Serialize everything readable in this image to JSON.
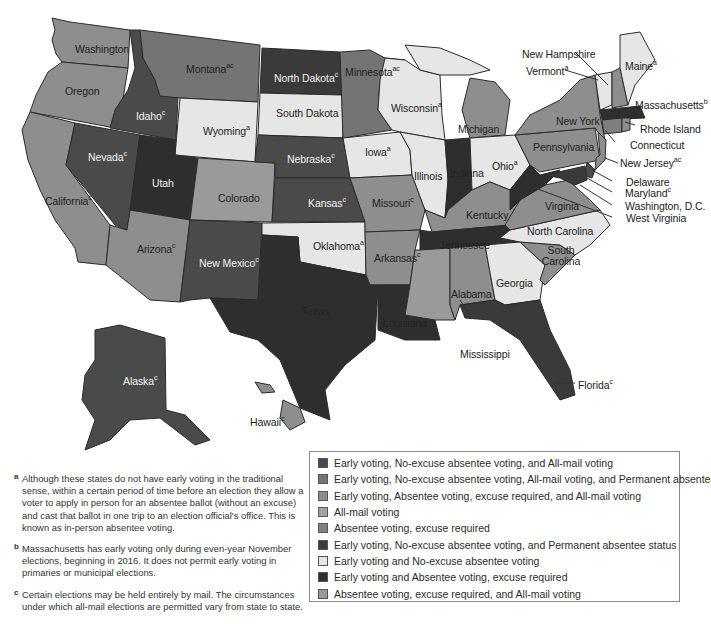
{
  "colors": {
    "c1": "#4a4a4a",
    "c2": "#747474",
    "c3": "#8e8e8e",
    "c4": "#a5a5a5",
    "c5": "#7f7f7f",
    "c6": "#3a3a3a",
    "c7": "#e6e6e6",
    "c8": "#2e2e2e",
    "c9": "#9a9a9a"
  },
  "legend": {
    "items": [
      {
        "label": "Early voting, No-excuse absentee voting, and All-mail voting",
        "swatch": "#4a4a4a"
      },
      {
        "label": "Early voting, No-excuse absentee voting, All-mail voting, and Permanent absentee status",
        "swatch": "#747474"
      },
      {
        "label": "Early voting, Absentee voting, excuse required, and All-mail voting",
        "swatch": "#8e8e8e"
      },
      {
        "label": "All-mail voting",
        "swatch": "#a5a5a5"
      },
      {
        "label": "Absentee voting, excuse required",
        "swatch": "#7f7f7f"
      },
      {
        "label": "Early voting, No-excuse absentee voting, and Permanent absentee status",
        "swatch": "#3a3a3a"
      },
      {
        "label": "Early voting and No-excuse absentee voting",
        "swatch": "#e6e6e6"
      },
      {
        "label": "Early voting and Absentee voting, excuse required",
        "swatch": "#2e2e2e"
      },
      {
        "label": "Absentee voting, excuse required,  and All-mail voting",
        "swatch": "#9a9a9a"
      }
    ]
  },
  "footnotes": [
    {
      "mark": "a",
      "text": "Although these states do not have early voting in the traditional sense, within a certain period of time before an election they allow a voter to apply in person for an absentee ballot (without an excuse) and cast that ballot in one trip to an election official's office. This is known as in-person absentee voting."
    },
    {
      "mark": "b",
      "text": "Massachusetts has early voting only during even-year November elections, beginning in 2016. It does not permit early voting in primaries or municipal elections."
    },
    {
      "mark": "c",
      "text": "Certain elections may be held entirely by mail. The circumstances under which all-mail elections are permitted vary from state to state."
    }
  ],
  "states": {
    "washington": {
      "name": "Washington",
      "sup": ""
    },
    "oregon": {
      "name": "Oregon",
      "sup": ""
    },
    "california": {
      "name": "California",
      "sup": "c"
    },
    "idaho": {
      "name": "Idaho",
      "sup": "c"
    },
    "nevada": {
      "name": "Nevada",
      "sup": "c"
    },
    "montana": {
      "name": "Montana",
      "sup": "ac"
    },
    "wyoming": {
      "name": "Wyoming",
      "sup": "a"
    },
    "utah": {
      "name": "Utah",
      "sup": ""
    },
    "arizona": {
      "name": "Arizona",
      "sup": "c"
    },
    "colorado": {
      "name": "Colorado",
      "sup": ""
    },
    "new_mexico": {
      "name": "New Mexico",
      "sup": "c"
    },
    "north_dakota": {
      "name": "North Dakota",
      "sup": "c"
    },
    "south_dakota": {
      "name": "South Dakota",
      "sup": ""
    },
    "nebraska": {
      "name": "Nebraska",
      "sup": "c"
    },
    "kansas": {
      "name": "Kansas",
      "sup": "c"
    },
    "oklahoma": {
      "name": "Oklahoma",
      "sup": "a"
    },
    "texas": {
      "name": "Texas",
      "sup": ""
    },
    "minnesota": {
      "name": "Minnesota",
      "sup": "ac"
    },
    "iowa": {
      "name": "Iowa",
      "sup": "a"
    },
    "missouri": {
      "name": "Missouri",
      "sup": "c"
    },
    "arkansas": {
      "name": "Arkansas",
      "sup": "c"
    },
    "louisiana": {
      "name": "Louisiana",
      "sup": ""
    },
    "wisconsin": {
      "name": "Wisconsin",
      "sup": "a"
    },
    "illinois": {
      "name": "Illinois",
      "sup": ""
    },
    "michigan": {
      "name": "Michigan",
      "sup": ""
    },
    "indiana": {
      "name": "Indiana",
      "sup": ""
    },
    "ohio": {
      "name": "Ohio",
      "sup": "a"
    },
    "kentucky": {
      "name": "Kentucky",
      "sup": ""
    },
    "tennessee": {
      "name": "Tennessee",
      "sup": ""
    },
    "mississippi": {
      "name": "Mississippi",
      "sup": ""
    },
    "alabama": {
      "name": "Alabama",
      "sup": ""
    },
    "georgia": {
      "name": "Georgia",
      "sup": ""
    },
    "florida": {
      "name": "Florida",
      "sup": "c"
    },
    "south_carolina": {
      "name": "South Carolina",
      "sup": ""
    },
    "north_carolina": {
      "name": "North Carolina",
      "sup": ""
    },
    "virginia": {
      "name": "Virginia",
      "sup": ""
    },
    "west_virginia": {
      "name": "West Virginia",
      "sup": ""
    },
    "pennsylvania": {
      "name": "Pennsylvania",
      "sup": ""
    },
    "new_york": {
      "name": "New York",
      "sup": ""
    },
    "new_jersey": {
      "name": "New Jersey",
      "sup": "ac"
    },
    "delaware": {
      "name": "Delaware",
      "sup": ""
    },
    "maryland": {
      "name": "Maryland",
      "sup": "c"
    },
    "washington_dc": {
      "name": "Washington, D.C.",
      "sup": ""
    },
    "connecticut": {
      "name": "Connecticut",
      "sup": ""
    },
    "rhode_island": {
      "name": "Rhode Island",
      "sup": ""
    },
    "massachusetts": {
      "name": "Massachusetts",
      "sup": "b"
    },
    "vermont": {
      "name": "Vermont",
      "sup": "a"
    },
    "new_hampshire": {
      "name": "New Hampshire",
      "sup": ""
    },
    "maine": {
      "name": "Maine",
      "sup": "a"
    },
    "alaska": {
      "name": "Alaska",
      "sup": "c"
    },
    "hawaii": {
      "name": "Hawaii",
      "sup": "c"
    }
  }
}
